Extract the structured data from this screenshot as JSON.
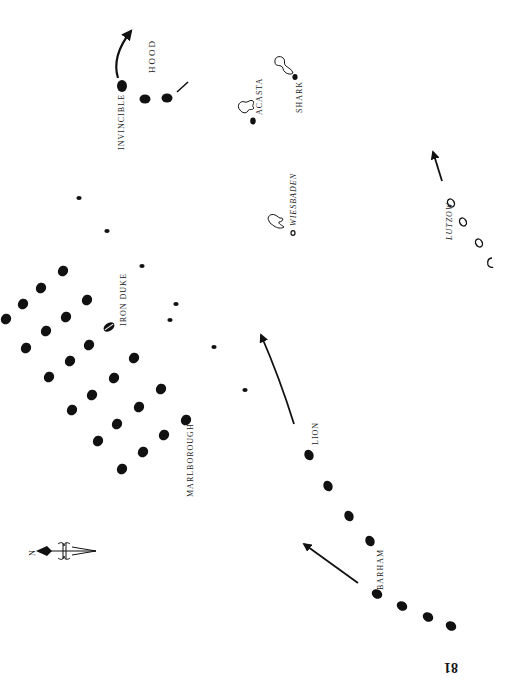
{
  "page": {
    "page_number": "81",
    "orientation": "rotated 90° counter-clockwise (printed sideways)"
  },
  "compass": {
    "label": "N",
    "icon": "compass-rose-north-arrow"
  },
  "labels": {
    "invincible": "INVINCIBLE",
    "hood": "HOOD",
    "acasta": "ACASTA",
    "shark": "SHARK",
    "wiesbaden": "WIESBADEN",
    "lutzow": "LUTZOW",
    "iron_duke": "IRON DUKE",
    "marlborough": "MARLBOROUGH",
    "lion": "LION",
    "barham": "BARHAM"
  },
  "colors": {
    "ink": "#111111",
    "paper": "#ffffff"
  },
  "fleets": {
    "grand_fleet_columns": [
      [
        [
          63,
          271
        ],
        [
          41,
          288
        ],
        [
          23,
          304
        ],
        [
          6,
          319
        ]
      ],
      [
        [
          87,
          300
        ],
        [
          66,
          317
        ],
        [
          46,
          331
        ],
        [
          26,
          348
        ]
      ],
      [
        [
          109,
          327
        ],
        [
          89,
          345
        ],
        [
          70,
          361
        ],
        [
          49,
          377
        ]
      ],
      [
        [
          134,
          358
        ],
        [
          114,
          378
        ],
        [
          92,
          395
        ],
        [
          72,
          410
        ]
      ],
      [
        [
          161,
          389
        ],
        [
          139,
          407
        ],
        [
          117,
          424
        ],
        [
          98,
          441
        ]
      ],
      [
        [
          186,
          420
        ],
        [
          164,
          435
        ],
        [
          143,
          452
        ],
        [
          122,
          469
        ]
      ]
    ],
    "iron_duke_position": [
      109,
      327
    ],
    "light_craft": [
      [
        79,
        198
      ],
      [
        107,
        231
      ],
      [
        142,
        266
      ],
      [
        176,
        304
      ],
      [
        170,
        320
      ],
      [
        214,
        347
      ],
      [
        245,
        390
      ]
    ],
    "invincible_squadron": [
      [
        122,
        86
      ],
      [
        146,
        99
      ],
      [
        167,
        98
      ]
    ],
    "battlecruisers_lion": [
      [
        309,
        455
      ],
      [
        328,
        486
      ],
      [
        349,
        516
      ],
      [
        368,
        540
      ]
    ],
    "fifth_battle_squadron_barham": [
      [
        377,
        594
      ],
      [
        402,
        605
      ],
      [
        427,
        617
      ],
      [
        451,
        626
      ]
    ],
    "german_lutzow_group": [
      [
        451,
        203
      ],
      [
        463,
        222
      ],
      [
        479,
        243
      ],
      [
        490,
        262
      ]
    ],
    "wiesbaden_position": [
      293,
      233
    ],
    "acasta_position": [
      253,
      121
    ],
    "shark_position": [
      295,
      77
    ]
  }
}
